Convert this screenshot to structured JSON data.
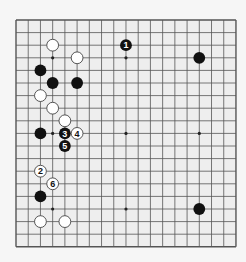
{
  "board": {
    "size": 19,
    "origin": {
      "x": 16,
      "y": 20
    },
    "cell": {
      "w": 12.22,
      "h": 12.6
    },
    "colors": {
      "background": "#eeeeee",
      "grid": "#555555",
      "black_stone": "#111111",
      "white_stone": "#ffffff",
      "white_outline": "#444444"
    },
    "star_points": [
      [
        3,
        3
      ],
      [
        9,
        3
      ],
      [
        15,
        3
      ],
      [
        3,
        9
      ],
      [
        9,
        9
      ],
      [
        15,
        9
      ],
      [
        3,
        15
      ],
      [
        9,
        15
      ],
      [
        15,
        15
      ]
    ]
  },
  "stones": [
    {
      "color": "white",
      "col": 3,
      "row": 2
    },
    {
      "color": "black",
      "col": 9,
      "row": 2,
      "label": "1"
    },
    {
      "color": "white",
      "col": 5,
      "row": 3
    },
    {
      "color": "black",
      "col": 15,
      "row": 3
    },
    {
      "color": "black",
      "col": 2,
      "row": 4
    },
    {
      "color": "black",
      "col": 3,
      "row": 5
    },
    {
      "color": "black",
      "col": 5,
      "row": 5
    },
    {
      "color": "white",
      "col": 2,
      "row": 6
    },
    {
      "color": "white",
      "col": 3,
      "row": 7
    },
    {
      "color": "white",
      "col": 4,
      "row": 8
    },
    {
      "color": "black",
      "col": 2,
      "row": 9
    },
    {
      "color": "black",
      "col": 4,
      "row": 9,
      "label": "3"
    },
    {
      "color": "white",
      "col": 5,
      "row": 9,
      "label": "4"
    },
    {
      "color": "black",
      "col": 4,
      "row": 10,
      "label": "5"
    },
    {
      "color": "white",
      "col": 2,
      "row": 12,
      "label": "2"
    },
    {
      "color": "white",
      "col": 3,
      "row": 13,
      "label": "6"
    },
    {
      "color": "black",
      "col": 2,
      "row": 14
    },
    {
      "color": "black",
      "col": 15,
      "row": 15
    },
    {
      "color": "white",
      "col": 2,
      "row": 16
    },
    {
      "color": "white",
      "col": 4,
      "row": 16
    }
  ]
}
